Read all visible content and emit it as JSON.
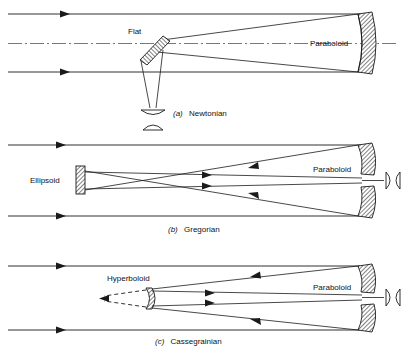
{
  "figure": {
    "background_color": "#ffffff",
    "ink_color": "#1a1a1a",
    "axis_color": "#555555"
  },
  "panels": [
    {
      "id": "newtonian",
      "caption_index": "(a)",
      "caption_name": "Newtonian",
      "labels": {
        "secondary": "Flat",
        "primary": "Paraboloid"
      },
      "elements": [
        "incoming-parallel-rays",
        "optical-axis",
        "paraboloid-primary-mirror",
        "flat-secondary-mirror",
        "converging-cone",
        "eyepiece-lenses"
      ]
    },
    {
      "id": "gregorian",
      "caption_index": "(b)",
      "caption_name": "Gregorian",
      "labels": {
        "secondary": "Ellipsoid",
        "primary": "Paraboloid"
      },
      "elements": [
        "incoming-parallel-rays",
        "paraboloid-primary-mirror",
        "ellipsoid-secondary-mirror",
        "real-focus-crossing",
        "exit-rays",
        "eyepiece-lenses"
      ]
    },
    {
      "id": "cassegrainian",
      "caption_index": "(c)",
      "caption_name": "Cassegrainian",
      "labels": {
        "secondary": "Hyperboloid",
        "primary": "Paraboloid"
      },
      "elements": [
        "incoming-parallel-rays",
        "paraboloid-primary-mirror",
        "hyperboloid-secondary-mirror",
        "virtual-focus-dashed-rays",
        "exit-rays",
        "eyepiece-lenses"
      ]
    }
  ]
}
